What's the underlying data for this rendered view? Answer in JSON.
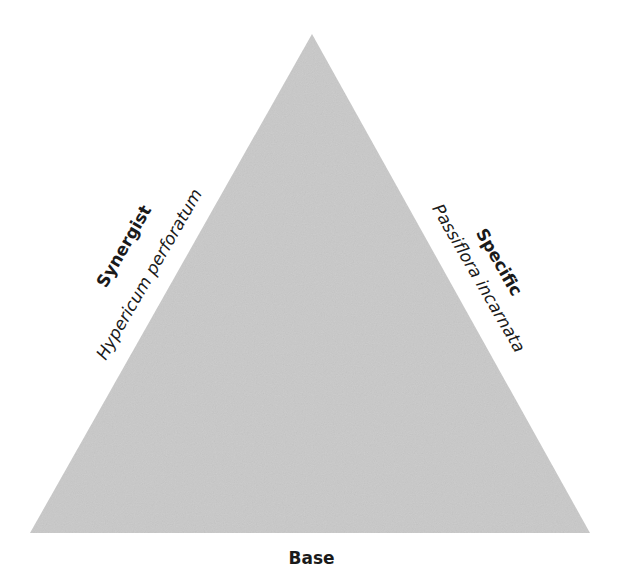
{
  "diagram": {
    "shape": "triangle",
    "fill_color": "#c8c8c8",
    "vertices": {
      "apex": [
        312,
        34
      ],
      "bottom_left": [
        30,
        533
      ],
      "bottom_right": [
        590,
        533
      ]
    },
    "sides": {
      "left": {
        "title": "Synergist",
        "subtitle": "Hypericum perforatum"
      },
      "right": {
        "title": "Specific",
        "subtitle": "Passiflora incarnata"
      },
      "bottom": {
        "title": "Base"
      }
    }
  }
}
